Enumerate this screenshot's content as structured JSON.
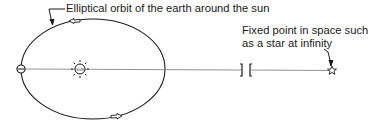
{
  "diagram": {
    "labels": {
      "orbit": "Elliptical orbit of the earth around the sun",
      "fixed_point_line1": "Fixed point in space such",
      "fixed_point_line2": "as a star at infinity"
    },
    "elements": {
      "sun": {
        "symbol": "sun-icon",
        "x": 80,
        "y": 69
      },
      "earth": {
        "symbol": "earth-icon",
        "x": 21,
        "y": 69
      },
      "orbit": {
        "cx": 93,
        "cy": 69,
        "rx": 72,
        "ry": 50
      },
      "star": {
        "symbol": "star-icon",
        "x": 332,
        "y": 70
      },
      "line_break": {
        "x1": 241,
        "x2": 251
      }
    },
    "colors": {
      "ink": "#1a1a1a",
      "background": "#ffffff",
      "line": "#6b6b6b"
    }
  }
}
